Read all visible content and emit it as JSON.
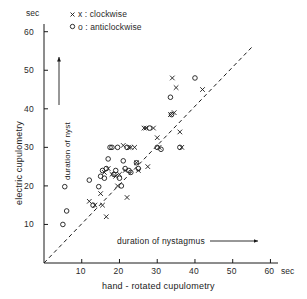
{
  "chart_data": {
    "type": "scatter",
    "title": "",
    "xlabel": "hand - rotated cupulometry",
    "ylabel": "electric cupulometry",
    "x_unit": "sec",
    "y_unit": "sec",
    "xlim": [
      0,
      62
    ],
    "ylim": [
      0,
      62
    ],
    "xticks": [
      10,
      20,
      30,
      40,
      50,
      60
    ],
    "yticks": [
      10,
      20,
      30,
      40,
      50,
      60
    ],
    "grid": false,
    "legend_position": "top-left-inside",
    "annotations": {
      "x_arrow_label": "duration of nystagmus",
      "y_arrow_label": "duration of nyst"
    },
    "reference_line": {
      "style": "dashed",
      "description": "identity line y = x",
      "from": [
        0,
        0
      ],
      "to": [
        56,
        56
      ]
    },
    "series": [
      {
        "name": "clockwise",
        "marker": "x",
        "legend_label": "x : clockwise",
        "points": [
          [
            12.0,
            16.0
          ],
          [
            13.5,
            15.0
          ],
          [
            15.0,
            18.0
          ],
          [
            15.5,
            15.0
          ],
          [
            16.0,
            23.5
          ],
          [
            16.5,
            12.0
          ],
          [
            17.0,
            24.5
          ],
          [
            18.0,
            23.0
          ],
          [
            19.0,
            22.5
          ],
          [
            19.5,
            20.0
          ],
          [
            20.0,
            23.0
          ],
          [
            21.0,
            30.5
          ],
          [
            21.5,
            24.0
          ],
          [
            22.0,
            17.0
          ],
          [
            22.5,
            30.0
          ],
          [
            23.0,
            30.0
          ],
          [
            24.0,
            30.0
          ],
          [
            24.5,
            26.0
          ],
          [
            25.0,
            24.0
          ],
          [
            26.5,
            35.0
          ],
          [
            27.0,
            35.0
          ],
          [
            27.5,
            25.0
          ],
          [
            29.0,
            35.0
          ],
          [
            30.0,
            32.5
          ],
          [
            30.5,
            30.0
          ],
          [
            33.5,
            38.5
          ],
          [
            34.0,
            48.0
          ],
          [
            34.5,
            39.0
          ],
          [
            35.0,
            45.5
          ],
          [
            36.0,
            34.0
          ],
          [
            36.5,
            30.0
          ],
          [
            42.0,
            45.0
          ]
        ]
      },
      {
        "name": "anticlockwise",
        "marker": "o",
        "legend_label": "o : anticlockwise",
        "points": [
          [
            5.0,
            10.0
          ],
          [
            5.5,
            19.8
          ],
          [
            6.0,
            13.5
          ],
          [
            12.0,
            21.5
          ],
          [
            13.0,
            15.0
          ],
          [
            14.5,
            19.8
          ],
          [
            15.0,
            22.5
          ],
          [
            15.5,
            24.0
          ],
          [
            16.0,
            22.0
          ],
          [
            16.5,
            24.5
          ],
          [
            17.0,
            27.0
          ],
          [
            17.5,
            30.0
          ],
          [
            18.0,
            30.0
          ],
          [
            18.5,
            23.0
          ],
          [
            19.0,
            24.0
          ],
          [
            19.5,
            30.0
          ],
          [
            20.0,
            22.0
          ],
          [
            20.5,
            20.0
          ],
          [
            21.0,
            26.5
          ],
          [
            21.5,
            24.5
          ],
          [
            22.0,
            30.0
          ],
          [
            22.5,
            24.0
          ],
          [
            23.0,
            23.5
          ],
          [
            24.5,
            26.0
          ],
          [
            25.0,
            24.5
          ],
          [
            28.0,
            35.0
          ],
          [
            30.0,
            30.0
          ],
          [
            31.0,
            29.5
          ],
          [
            33.5,
            43.0
          ],
          [
            33.8,
            38.5
          ],
          [
            36.0,
            30.0
          ],
          [
            40.0,
            48.0
          ]
        ]
      }
    ]
  },
  "legend": {
    "clockwise": "x : clockwise",
    "anticlockwise": "o : anticlockwise"
  },
  "axes": {
    "x_title": "hand - rotated cupulometry",
    "y_title": "electric cupulometry",
    "x_unit": "sec",
    "y_unit": "sec",
    "x_ticks": [
      "10",
      "20",
      "30",
      "40",
      "50",
      "60"
    ],
    "y_ticks": [
      "10",
      "20",
      "30",
      "40",
      "50",
      "60"
    ],
    "x_inner_label": "duration of nystagmus",
    "y_inner_label": "duration of nyst"
  }
}
